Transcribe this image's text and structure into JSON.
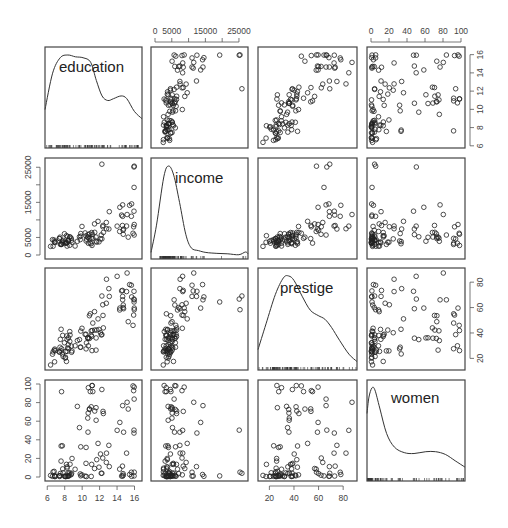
{
  "chart_data": {
    "type": "scatter",
    "subtype": "scatterplot-matrix",
    "title": "",
    "variables": [
      "education",
      "income",
      "prestige",
      "women"
    ],
    "diagonal": "kernel density with rug",
    "panel_layout": {
      "cols_x": [
        [
          45,
          142
        ],
        [
          151,
          248
        ],
        [
          258,
          357
        ],
        [
          367,
          465
        ]
      ],
      "rows_y": [
        [
          47,
          148
        ],
        [
          158,
          259
        ],
        [
          268,
          370
        ],
        [
          380,
          481
        ]
      ]
    },
    "axes": {
      "education": {
        "range": [
          6.2,
          16.4
        ],
        "ticks": [
          6,
          8,
          10,
          12,
          14,
          16
        ],
        "tick_labels": [
          "6",
          "8",
          "10",
          "12",
          "14",
          "16"
        ],
        "position": "bottom (col 1) / right (row 1)"
      },
      "income": {
        "range": [
          0,
          26500
        ],
        "ticks": [
          0,
          5000,
          10000,
          15000,
          20000,
          25000
        ],
        "tick_labels": [
          "0",
          "5000",
          "",
          "15000",
          "",
          "25000"
        ],
        "position": "top (col 2) / left (row 2)"
      },
      "prestige": {
        "range": [
          14,
          88
        ],
        "ticks": [
          20,
          40,
          60,
          80
        ],
        "tick_labels": [
          "20",
          "40",
          "60",
          "80"
        ],
        "position": "bottom (col 3) / right (row 3)"
      },
      "women": {
        "range": [
          0,
          100
        ],
        "ticks": [
          0,
          20,
          40,
          60,
          80,
          100
        ],
        "tick_labels": [
          "0",
          "20",
          "40",
          "60",
          "80",
          "100"
        ],
        "position": "top (col 4) / left (row 4)"
      }
    },
    "axis_tick_labels_visible": {
      "top": {
        "col2": [
          "0",
          "5000",
          "15000",
          "25000"
        ],
        "col4": [
          "0",
          "20",
          "40",
          "60",
          "80",
          "100"
        ]
      },
      "bottom": {
        "col1": [
          "6",
          "8",
          "10",
          "12",
          "14",
          "16"
        ],
        "col3": [
          "20",
          "40",
          "60",
          "80"
        ]
      },
      "left": {
        "row2": [
          "0",
          "5000",
          "15000",
          "25000"
        ],
        "row4": [
          "0",
          "20",
          "40",
          "60",
          "80",
          "100"
        ]
      },
      "right": {
        "row1": [
          "6",
          "8",
          "10",
          "12",
          "14",
          "16"
        ],
        "row3": [
          "20",
          "40",
          "60",
          "80"
        ]
      }
    },
    "density_curves": {
      "education": [
        [
          6.2,
          0.4
        ],
        [
          7.0,
          0.8
        ],
        [
          7.8,
          0.97
        ],
        [
          8.6,
          1.0
        ],
        [
          9.4,
          0.98
        ],
        [
          10.2,
          0.97
        ],
        [
          11.0,
          0.92
        ],
        [
          11.6,
          0.72
        ],
        [
          12.2,
          0.55
        ],
        [
          12.8,
          0.5
        ],
        [
          13.4,
          0.52
        ],
        [
          14.2,
          0.55
        ],
        [
          14.8,
          0.52
        ],
        [
          15.6,
          0.38
        ],
        [
          16.4,
          0.3
        ]
      ],
      "income": [
        [
          0,
          0.05
        ],
        [
          1500,
          0.35
        ],
        [
          3500,
          0.88
        ],
        [
          4800,
          1.0
        ],
        [
          6200,
          0.9
        ],
        [
          7800,
          0.6
        ],
        [
          9500,
          0.25
        ],
        [
          11000,
          0.1
        ],
        [
          13000,
          0.07
        ],
        [
          15000,
          0.05
        ],
        [
          18000,
          0.04
        ],
        [
          21000,
          0.035
        ],
        [
          24000,
          0.025
        ],
        [
          25800,
          0.055
        ],
        [
          26500,
          0.035
        ]
      ],
      "prestige": [
        [
          14,
          0.2
        ],
        [
          20,
          0.48
        ],
        [
          27,
          0.8
        ],
        [
          33,
          0.98
        ],
        [
          37,
          1.0
        ],
        [
          41,
          0.95
        ],
        [
          47,
          0.78
        ],
        [
          53,
          0.63
        ],
        [
          59,
          0.57
        ],
        [
          64,
          0.53
        ],
        [
          69,
          0.44
        ],
        [
          75,
          0.3
        ],
        [
          82,
          0.15
        ],
        [
          88,
          0.07
        ]
      ],
      "women": [
        [
          0,
          0.72
        ],
        [
          2,
          0.9
        ],
        [
          5,
          1.0
        ],
        [
          8,
          0.98
        ],
        [
          13,
          0.78
        ],
        [
          20,
          0.5
        ],
        [
          28,
          0.35
        ],
        [
          38,
          0.29
        ],
        [
          48,
          0.28
        ],
        [
          60,
          0.3
        ],
        [
          70,
          0.3
        ],
        [
          80,
          0.27
        ],
        [
          90,
          0.2
        ],
        [
          100,
          0.13
        ]
      ]
    },
    "points": {
      "education": [
        13.11,
        12.26,
        12.77,
        11.42,
        14.62,
        15.64,
        15.09,
        15.44,
        14.52,
        14.64,
        14.71,
        14.69,
        12.39,
        12.36,
        13.06,
        10.93,
        12.79,
        14.3,
        15.97,
        15.94,
        14.01,
        14.32,
        14.64,
        15.15,
        15.94,
        15.67,
        15.95,
        15.28,
        14.75,
        15.96,
        15.97,
        15.83,
        15.9,
        12.43,
        11.6,
        11.16,
        11.44,
        10.69,
        12.26,
        10.64,
        10.71,
        11.93,
        12.19,
        11.59,
        11.22,
        11.13,
        11.09,
        12.1,
        11.67,
        11.04,
        9.84,
        11.04,
        9.98,
        10.44,
        11.82,
        10.83,
        10.45,
        9.69,
        9.45,
        10.67,
        10.84,
        9.84,
        8.75,
        8.61,
        8.58,
        10.34,
        8.84,
        8.23,
        7.77,
        8.45,
        8.41,
        10.49,
        7.97,
        8.33,
        9.78,
        7.73,
        7.46,
        8.05,
        7.82,
        6.79,
        7.38,
        8.43,
        6.84,
        7.42,
        7.5,
        8.79,
        8.09,
        6.92,
        8.1,
        6.6,
        6.38,
        8.27,
        7.58,
        6.67,
        6.86,
        9.19,
        8.2,
        7.59,
        8.58,
        8.27,
        7.64
      ],
      "income": [
        12351,
        25879,
        9271,
        8865,
        8403,
        11030,
        8258,
        14163,
        11377,
        11023,
        5902,
        7059,
        8425,
        8049,
        7405,
        3384,
        7482,
        6705,
        25308,
        12480,
        8225,
        13597,
        14282,
        11536,
        25081,
        14558,
        19263,
        5086,
        7404,
        5692,
        8690,
        6196,
        8034,
        6427,
        3920,
        5894,
        6455,
        5116,
        4593,
        5052,
        3341,
        3738,
        5695,
        5115,
        4746,
        2723,
        6400,
        4593,
        3660,
        4812,
        6113,
        3200,
        8135,
        5456,
        9593,
        4671,
        3999,
        5198,
        3902,
        5811,
        6036,
        5373,
        4779,
        5130,
        5135,
        6286,
        3631,
        3400,
        3510,
        4090,
        4040,
        4520,
        6055,
        5300,
        4382,
        3825,
        5080,
        3915,
        4140,
        4270,
        4690,
        4165,
        3620,
        4690,
        3025,
        4225,
        3360,
        3585,
        3485,
        4370,
        2460,
        3490,
        3025,
        2505,
        3825,
        2560,
        5500,
        3205,
        2770,
        2540,
        3003
      ],
      "prestige": [
        68.8,
        69.1,
        63.4,
        56.8,
        73.5,
        77.6,
        72.6,
        78.1,
        73.1,
        68.8,
        62.0,
        60.0,
        53.8,
        62.2,
        74.9,
        55.1,
        82.3,
        58.1,
        58.3,
        72.8,
        84.6,
        59.6,
        66.1,
        87.2,
        66.7,
        68.4,
        64.4,
        48.9,
        59.1,
        66.1,
        59.6,
        46.0,
        54.1,
        44.0,
        36.1,
        41.9,
        42.3,
        35.9,
        38.7,
        36.2,
        29.9,
        42.8,
        38.5,
        26.5,
        47.8,
        26.1,
        37.2,
        40.2,
        42.3,
        41.7,
        28.8,
        38.3,
        43.7,
        39.0,
        51.1,
        53.6,
        27.5,
        34.8,
        34.0,
        35.9,
        35.7,
        41.5,
        29.7,
        38.4,
        33.4,
        38.9,
        25.9,
        37.7,
        38.1,
        27.6,
        30.7,
        32.2,
        32.3,
        28.2,
        28.8,
        23.5,
        28.8,
        20.2,
        21.5,
        26.5,
        24.9,
        36.2,
        17.3,
        25.2,
        35.0,
        24.8,
        20.9,
        26.1,
        25.4,
        23.3,
        14.8,
        35.0,
        25.9,
        25.1,
        27.3,
        29.9,
        17.6,
        42.9,
        41.1,
        25.5,
        27.6
      ],
      "women": [
        11.16,
        4.02,
        15.7,
        9.11,
        11.68,
        5.13,
        25.65,
        2.69,
        1.03,
        0.94,
        1.91,
        3.64,
        70.56,
        20.4,
        34.06,
        91.85,
        25.64,
        8.45,
        5.18,
        47.26,
        50.19,
        58.69,
        76.74,
        80.35,
        50.39,
        0.73,
        1.16,
        73.07,
        48.18,
        83.78,
        96.67,
        97.97,
        92.84,
        68.24,
        61.01,
        98.28,
        70.92,
        68.78,
        94.07,
        63.34,
        96.04,
        10.56,
        4.03,
        74.54,
        91.83,
        98.36,
        13.58,
        24.71,
        18.65,
        75.49,
        32.45,
        0.6,
        2.31,
        14.65,
        36.12,
        73.22,
        31.79,
        53.09,
        75.92,
        48.24,
        72.64,
        1.27,
        2.53,
        13.72,
        4.42,
        0.96,
        19.92,
        0.64,
        8.71,
        0.98,
        1.13,
        0.47,
        0.85,
        0.93,
        3.32,
        33.57,
        1.44,
        0.53,
        4.56,
        6.06,
        1.36,
        4.31,
        0.52,
        0.56,
        3.85,
        4.01,
        0.81,
        0.52,
        0.47,
        0.74,
        1.71,
        10.94,
        17.09,
        5.5,
        1.61,
        8.33,
        13.58,
        33.35,
        2.0,
        9.47,
        91.76
      ]
    }
  }
}
